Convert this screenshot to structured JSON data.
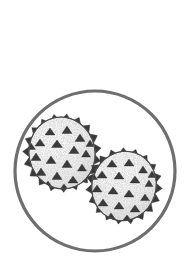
{
  "figure": {
    "kind": "scientific-illustration",
    "subject": "pollen grains",
    "description": "Two spiny (echinate) pollen grains drawn in stipple ink style inside a circular microscope field of view",
    "background_color": "#ffffff",
    "canvas": {
      "width": 190,
      "height": 280
    }
  },
  "field_of_view": {
    "label": "circular field of view",
    "shape": "circle",
    "center_x": 95,
    "center_y": 171,
    "radius": 80,
    "stroke_color": "#6e6e6e",
    "stroke_width": 3.2
  },
  "grains": [
    {
      "id": "grain-upper-left",
      "label": "Pollen grain (upper left)",
      "center_x": 62,
      "center_y": 153,
      "radius_x": 33,
      "radius_y": 36,
      "rotation_deg": -12,
      "spine_count": 19,
      "spine_length": 6.5,
      "surface_spine_count": 18,
      "outline_color": "#4a4a4a",
      "body_fill": "#f2f2f2",
      "stipple_color": "#8d8d8d",
      "spine_color": "#3a3a3a",
      "z_order": 1
    },
    {
      "id": "grain-lower-right",
      "label": "Pollen grain (lower right)",
      "center_x": 124,
      "center_y": 186,
      "radius_x": 32,
      "radius_y": 35,
      "rotation_deg": 18,
      "spine_count": 19,
      "spine_length": 6.5,
      "surface_spine_count": 18,
      "outline_color": "#4a4a4a",
      "body_fill": "#f2f2f2",
      "stipple_color": "#8d8d8d",
      "spine_color": "#3a3a3a",
      "z_order": 2
    }
  ],
  "palette": {
    "background": "#ffffff",
    "frame_gray": "#6e6e6e",
    "outline_gray": "#4a4a4a",
    "spine_dark": "#3a3a3a",
    "stipple_gray": "#8d8d8d",
    "body_light": "#f2f2f2"
  }
}
